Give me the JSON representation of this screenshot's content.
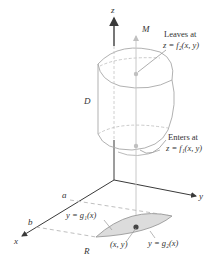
{
  "diagram": {
    "type": "3d-region-projection",
    "axes": {
      "z_label": "z",
      "y_label": "y",
      "x_label": "x"
    },
    "labels": {
      "solid": "D",
      "line_top": "M",
      "leaves_line1": "Leaves at",
      "leaves_line2": "z = f₂(x, y)",
      "enters_line1": "Enters at",
      "enters_line2": "z = f₁(x, y)",
      "x_a": "a",
      "x_b": "b",
      "g1": "y = g₁(x)",
      "g2": "y = g₂(x)",
      "point": "(x, y)",
      "region": "R"
    },
    "colors": {
      "axis": "#3a3a3a",
      "outline": "#a8a8a8",
      "dashed": "#b8b8b8",
      "region_fill": "#dcdcdc",
      "line_m": "#c8c8c8",
      "point": "#444444",
      "text": "#333333"
    }
  }
}
